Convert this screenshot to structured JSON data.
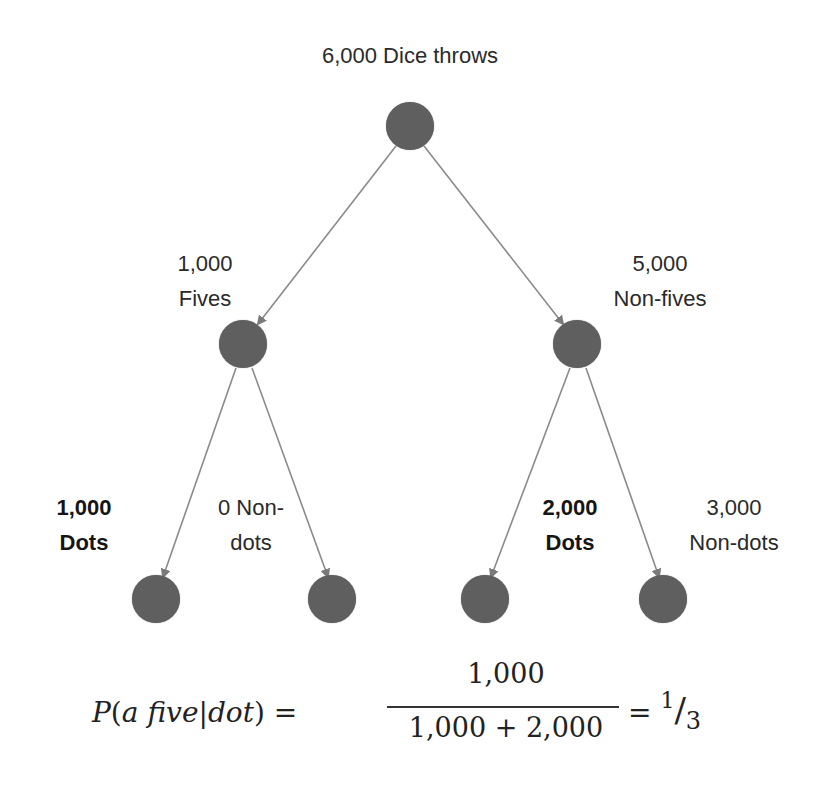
{
  "diagram": {
    "type": "probability-tree",
    "root": {
      "count": "6,000",
      "label": "Dice throws",
      "text": "6,000 Dice throws"
    },
    "level1": [
      {
        "id": "fives",
        "count": "1,000",
        "label": "Fives"
      },
      {
        "id": "non-fives",
        "count": "5,000",
        "label": "Non-fives"
      }
    ],
    "level2": [
      {
        "id": "fives-dots",
        "parent": "fives",
        "count": "1,000",
        "label": "Dots",
        "bold": true
      },
      {
        "id": "fives-non-dots",
        "parent": "fives",
        "count": "0 Non-",
        "label": "dots",
        "bold": false
      },
      {
        "id": "non-fives-dots",
        "parent": "non-fives",
        "count": "2,000",
        "label": "Dots",
        "bold": true
      },
      {
        "id": "non-fives-non-dots",
        "parent": "non-fives",
        "count": "3,000",
        "label": "Non-dots",
        "bold": false
      }
    ],
    "colors": {
      "node": "#5f5f5f",
      "edge": "#8a8a8a",
      "text": "#2a2a2a"
    }
  },
  "equation": {
    "lhs_P": "P",
    "lhs_open": "(",
    "lhs_a": "a",
    "lhs_five": "five",
    "lhs_bar": "|",
    "lhs_dot": "dot",
    "lhs_close": ")",
    "equals1": "=",
    "numerator": "1,000",
    "denominator": "1,000 + 2,000",
    "equals2": "=",
    "result_num": "1",
    "result_slash": "/",
    "result_den": "3"
  }
}
